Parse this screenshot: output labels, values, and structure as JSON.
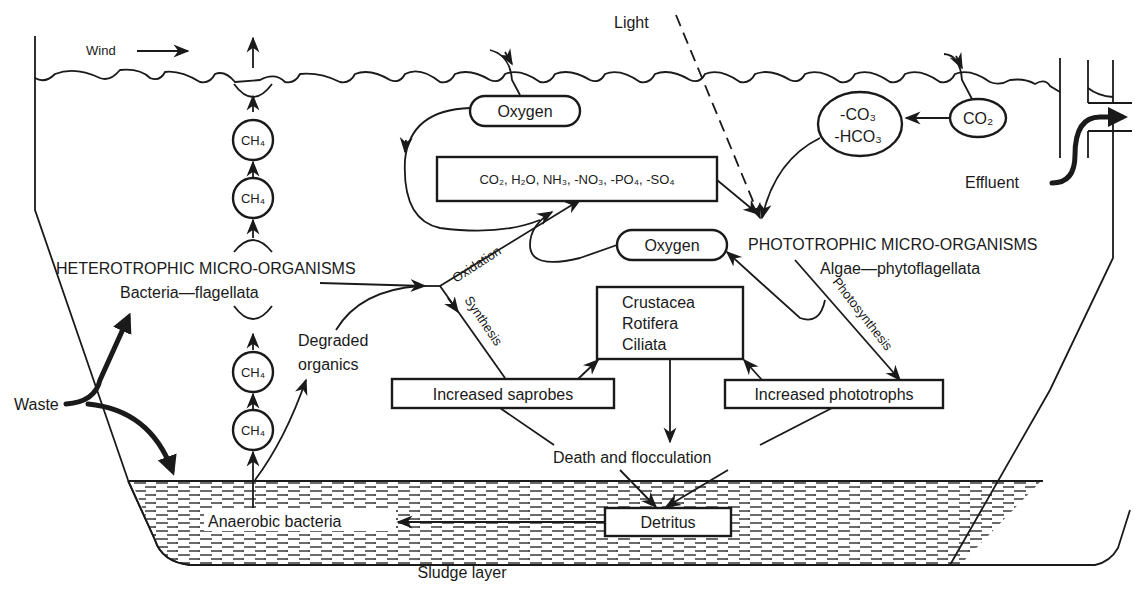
{
  "diagram": {
    "ink_color": "#1a1a1a",
    "background": "#ffffff",
    "labels": {
      "wind": "Wind",
      "light": "Light",
      "oxygen_top": "Oxygen",
      "oxygen_mid": "Oxygen",
      "products": "CO₂, H₂O, NH₃, -NO₃, -PO₄, -SO₄",
      "carbonate_1": "-CO₃",
      "carbonate_2": "-HCO₃",
      "co2": "CO₂",
      "effluent": "Effluent",
      "heterotrophic": "HETEROTROPHIC MICRO-ORGANISMS",
      "heterotrophic_sub": "Bacteria—flagellata",
      "phototrophic": "PHOTOTROPHIC MICRO-ORGANISMS",
      "phototrophic_sub": "Algae—phytoflagellata",
      "oxidation": "Oxidation",
      "synthesis": "Synthesis",
      "photosynthesis": "Photosynthesis",
      "degraded_1": "Degraded",
      "degraded_2": "organics",
      "grazers": [
        "Crustacea",
        "Rotifera",
        "Ciliata"
      ],
      "increased_saprobes": "Increased saprobes",
      "increased_phototrophs": "Increased phototrophs",
      "death": "Death and flocculation",
      "waste": "Waste",
      "anaerobic": "Anaerobic bacteria",
      "detritus": "Detritus",
      "sludge": "Sludge layer",
      "ch4": "CH₄"
    },
    "methane_bubbles": [
      "CH₄",
      "CH₄",
      "CH₄",
      "CH₄"
    ]
  }
}
